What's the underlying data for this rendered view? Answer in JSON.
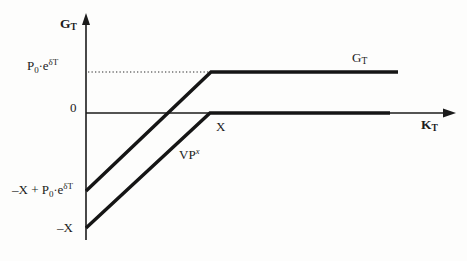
{
  "figure": {
    "kind": "payoff-diagram",
    "background_color": "#fdfdfc",
    "ink_color": "#1b1b1b"
  },
  "axes": {
    "y_axis": {
      "name_main": "G",
      "name_sub": "T",
      "label_full": "G_T"
    },
    "x_axis": {
      "name_main": "K",
      "name_sub": "T",
      "label_full": "K_T"
    },
    "origin_tick": "0",
    "x_tick": "X"
  },
  "value_labels": {
    "upper_dotted_level": {
      "lead": "P",
      "sub": "0",
      "dot": "·",
      "base": "e",
      "exponent": "δT",
      "full": "P0·eδT"
    },
    "upper_curve_intercept": {
      "lead": "–X + P",
      "sub": "0",
      "dot": "·",
      "base": "e",
      "exponent": "δT",
      "full": "–X + P0·eδT"
    },
    "lower_curve_intercept": {
      "full": "–X"
    }
  },
  "curves": [
    {
      "id": "upper",
      "label_main": "G",
      "label_sub": "T",
      "label_full": "G_T",
      "style": "thick-solid",
      "description": "hockey-stick rising from negative intercept to flat plateau at P0·eδT",
      "points": [
        [
          86,
          191
        ],
        [
          211,
          72
        ],
        [
          398,
          72
        ]
      ]
    },
    {
      "id": "lower",
      "label_main": "VP",
      "label_sup": "x",
      "label_full": "VPx",
      "style": "thick-solid",
      "description": "hockey-stick rising from –X to flat plateau along the zero axis",
      "points": [
        [
          86,
          228
        ],
        [
          210,
          113
        ],
        [
          390,
          113
        ]
      ]
    }
  ],
  "guides": {
    "dotted_level_line": {
      "style": "dotted",
      "y": 72,
      "x_start": 87,
      "x_end": 211
    }
  },
  "geometry": {
    "y_axis_x": 86,
    "x_axis_y": 113,
    "y_axis_top": 14,
    "y_axis_bottom": 240,
    "x_axis_left": 86,
    "x_axis_right": 455,
    "kink_x": 211
  }
}
